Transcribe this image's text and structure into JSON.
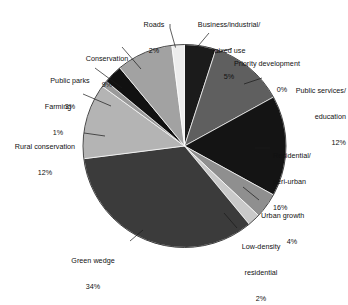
{
  "chart_data": {
    "type": "pie",
    "title": "",
    "subtitle": "",
    "xlabel": "",
    "ylabel": "",
    "legend_position": "callout-labels",
    "grid": false,
    "total_percent": 100,
    "categories": [
      "Business/industrial/\nmixed use",
      "Priority development",
      "Public services/\neducation",
      "Residential/\nperi-urban",
      "Urban growth",
      "Low-density\nresidential",
      "Green wedge",
      "Rural conservation",
      "Farming",
      "Public parks",
      "Conservation",
      "Roads"
    ],
    "values": [
      5,
      0,
      12,
      16,
      4,
      2,
      34,
      12,
      1,
      3,
      9,
      2
    ],
    "value_labels": [
      "5%",
      "0%",
      "12%",
      "16%",
      "4%",
      "2%",
      "34%",
      "12%",
      "1%",
      "3%",
      "9%",
      "2%"
    ],
    "colors": [
      "#1b1b1b",
      "#8c8c8c",
      "#5f5f5f",
      "#141414",
      "#8f8f8f",
      "#c9c9c9",
      "#3b3b3b",
      "#b4b4b4",
      "#9a9a9a",
      "#111111",
      "#a2a2a2",
      "#ededed"
    ],
    "slices": [
      {
        "name": "Business/industrial/\nmixed use",
        "label_lines": [
          "Business/industrial/",
          "mixed use",
          "5%"
        ],
        "value": 5,
        "value_label": "5%",
        "color": "#1b1b1b"
      },
      {
        "name": "Priority development",
        "label_lines": [
          "Priority development",
          "0%"
        ],
        "value": 0,
        "value_label": "0%",
        "color": "#8c8c8c"
      },
      {
        "name": "Public services/\neducation",
        "label_lines": [
          "Public services/",
          "education",
          "12%"
        ],
        "value": 12,
        "value_label": "12%",
        "color": "#5f5f5f"
      },
      {
        "name": "Residential/\nperi-urban",
        "label_lines": [
          "Residential/",
          "peri-urban",
          "16%"
        ],
        "value": 16,
        "value_label": "16%",
        "color": "#141414"
      },
      {
        "name": "Urban growth",
        "label_lines": [
          "Urban growth",
          "4%"
        ],
        "value": 4,
        "value_label": "4%",
        "color": "#8f8f8f"
      },
      {
        "name": "Low-density\nresidential",
        "label_lines": [
          "Low-density",
          "residential",
          "2%"
        ],
        "value": 2,
        "value_label": "2%",
        "color": "#c9c9c9"
      },
      {
        "name": "Green wedge",
        "label_lines": [
          "Green wedge",
          "34%"
        ],
        "value": 34,
        "value_label": "34%",
        "color": "#3b3b3b"
      },
      {
        "name": "Rural conservation",
        "label_lines": [
          "Rural conservation",
          "12%"
        ],
        "value": 12,
        "value_label": "12%",
        "color": "#b4b4b4"
      },
      {
        "name": "Farming",
        "label_lines": [
          "Farming",
          "1%"
        ],
        "value": 1,
        "value_label": "1%",
        "color": "#9a9a9a"
      },
      {
        "name": "Public parks",
        "label_lines": [
          "Public parks",
          "3%"
        ],
        "value": 3,
        "value_label": "3%",
        "color": "#111111"
      },
      {
        "name": "Conservation",
        "label_lines": [
          "Conservation",
          "9%"
        ],
        "value": 9,
        "value_label": "9%",
        "color": "#a2a2a2"
      },
      {
        "name": "Roads",
        "label_lines": [
          "Roads",
          "2%"
        ],
        "value": 2,
        "value_label": "2%",
        "color": "#ededed"
      }
    ]
  },
  "labels": {
    "business_industrial": {
      "l1": "Business/industrial/",
      "l2": "mixed use",
      "pct": "5%"
    },
    "priority_development": {
      "l1": "Priority development",
      "pct": "0%"
    },
    "public_services": {
      "l1": "Public services/",
      "l2": "education",
      "pct": "12%"
    },
    "residential_peri_urban": {
      "l1": "Residential/",
      "l2": "peri-urban",
      "pct": "16%"
    },
    "urban_growth": {
      "l1": "Urban growth",
      "pct": "4%"
    },
    "low_density_residential": {
      "l1": "Low-density",
      "l2": "residential",
      "pct": "2%"
    },
    "green_wedge": {
      "l1": "Green wedge",
      "pct": "34%"
    },
    "rural_conservation": {
      "l1": "Rural conservation",
      "pct": "12%"
    },
    "farming": {
      "l1": "Farming",
      "pct": "1%"
    },
    "public_parks": {
      "l1": "Public parks",
      "pct": "3%"
    },
    "conservation": {
      "l1": "Conservation",
      "pct": "9%"
    },
    "roads": {
      "l1": "Roads",
      "pct": "2%"
    }
  }
}
